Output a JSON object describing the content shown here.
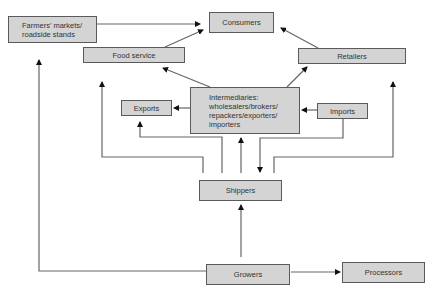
{
  "diagram": {
    "type": "flowchart",
    "nodes": {
      "consumers": {
        "label": "Consumers"
      },
      "farmers_markets": {
        "label": "Farmers' markets/\nroadside stands"
      },
      "food_service": {
        "label": "Food service"
      },
      "retailers": {
        "label": "Retailers"
      },
      "intermediaries": {
        "label": "Intermediaries:\nwholesalers/brokers/\nrepackers/exporters/\nimporters"
      },
      "exports": {
        "label": "Exports"
      },
      "imports": {
        "label": "Imports"
      },
      "shippers": {
        "label": "Shippers"
      },
      "growers": {
        "label": "Growers"
      },
      "processors": {
        "label": "Processors"
      }
    },
    "edges": [
      {
        "from": "farmers_markets",
        "to": "consumers"
      },
      {
        "from": "food_service",
        "to": "consumers"
      },
      {
        "from": "retailers",
        "to": "consumers"
      },
      {
        "from": "intermediaries",
        "to": "food_service"
      },
      {
        "from": "intermediaries",
        "to": "retailers"
      },
      {
        "from": "intermediaries",
        "to": "exports"
      },
      {
        "from": "imports",
        "to": "intermediaries"
      },
      {
        "from": "imports",
        "to": "shippers"
      },
      {
        "from": "shippers",
        "to": "food_service"
      },
      {
        "from": "shippers",
        "to": "exports"
      },
      {
        "from": "shippers",
        "to": "intermediaries"
      },
      {
        "from": "shippers",
        "to": "retailers"
      },
      {
        "from": "growers",
        "to": "shippers"
      },
      {
        "from": "growers",
        "to": "farmers_markets"
      },
      {
        "from": "growers",
        "to": "processors"
      }
    ],
    "colors": {
      "box_fill": "#d4d4d4",
      "box_border": "#5a5a5a",
      "line": "#666666",
      "arrowhead": "#111111",
      "text": "#333333"
    }
  }
}
